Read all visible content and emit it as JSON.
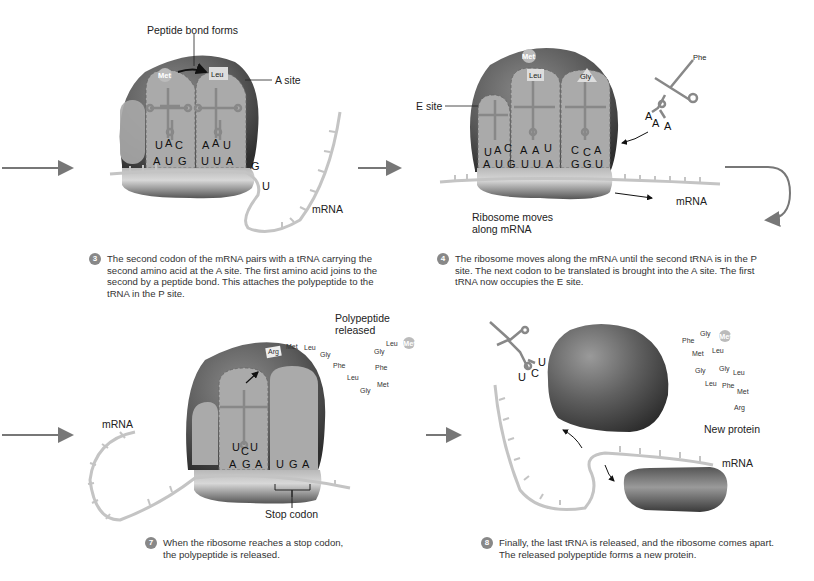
{
  "colors": {
    "ribosome_dark": "#4a4a4a",
    "ribosome_mid": "#7a7a7a",
    "site_fill": "#a8a8a8",
    "mrna": "#c4c4c4",
    "trna": "#8a8a8a",
    "arrow": "#777777",
    "badge": "#888888"
  },
  "panels": [
    {
      "step": "3",
      "labels": {
        "peptide_bond": "Peptide bond forms",
        "a_site": "A site",
        "mrna": "mRNA"
      },
      "amino_acids": [
        "Met",
        "Leu"
      ],
      "anticodons": [
        [
          "U",
          "A",
          "C"
        ],
        [
          "A",
          "A",
          "U"
        ]
      ],
      "codons": [
        "A",
        "U",
        "G",
        "U",
        "U",
        "A",
        "G",
        "U"
      ],
      "caption": "The second codon of the mRNA pairs with a tRNA carrying the second amino acid at the A site. The first amino acid joins to the second by a peptide bond. This attaches the polypeptide to the tRNA in the P site."
    },
    {
      "step": "4",
      "labels": {
        "e_site": "E site",
        "mrna": "mRNA",
        "ribosome_moves": "Ribosome moves",
        "along_mrna": "along mRNA"
      },
      "amino_acids": [
        "Met",
        "Leu",
        "Gly",
        "Phe"
      ],
      "anticodons": [
        [
          "U",
          "A",
          "C"
        ],
        [
          "A",
          "A",
          "U"
        ],
        [
          "C",
          "C",
          "A"
        ],
        [
          "A",
          "A",
          "A"
        ]
      ],
      "codons": [
        "A",
        "U",
        "G",
        "U",
        "U",
        "A",
        "G",
        "G",
        "U"
      ],
      "caption": "The ribosome moves along the mRNA until the second tRNA is in the P site. The next codon to be translated is brought into the A site. The first tRNA now occupies the E site."
    },
    {
      "step": "7",
      "labels": {
        "polypeptide_released_1": "Polypeptide",
        "polypeptide_released_2": "released",
        "mrna": "mRNA",
        "stop_codon": "Stop codon"
      },
      "polypeptide_chain": [
        "Arg",
        "Met",
        "Leu",
        "Gly",
        "Phe",
        "Leu",
        "Gly",
        "Met",
        "Phe",
        "Gly",
        "Leu",
        "Met"
      ],
      "anticodon": [
        "U",
        "C",
        "U"
      ],
      "codons": [
        "A",
        "G",
        "A",
        "U",
        "G",
        "A"
      ],
      "caption": "When the ribosome reaches a stop codon, the polypeptide is released."
    },
    {
      "step": "8",
      "labels": {
        "new_protein": "New protein",
        "mrna": "mRNA"
      },
      "trna_anticodon": [
        "U",
        "C",
        "U"
      ],
      "protein_residues": [
        "Phe",
        "Gly",
        "Met",
        "Met",
        "Leu",
        "Gly",
        "Gly",
        "Leu",
        "Leu",
        "Phe",
        "Met",
        "Arg"
      ],
      "caption": "Finally, the last tRNA is released, and the ribosome comes apart. The released polypeptide forms a new protein."
    }
  ]
}
